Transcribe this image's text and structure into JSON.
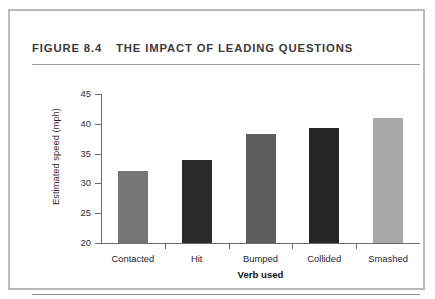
{
  "figure": {
    "number": "FIGURE 8.4",
    "title": "THE IMPACT OF LEADING QUESTIONS"
  },
  "chart_data": {
    "type": "bar",
    "title": "THE IMPACT OF LEADING QUESTIONS",
    "xlabel": "Verb used",
    "ylabel": "Estimated speed (mph)",
    "categories": [
      "Contacted",
      "Hit",
      "Bumped",
      "Collided",
      "Smashed"
    ],
    "values": [
      32.0,
      34.0,
      38.3,
      39.3,
      41.0
    ],
    "colors": [
      "#767676",
      "#2b2b2b",
      "#5e5e5e",
      "#262626",
      "#a8a8a8"
    ],
    "ylim": [
      20,
      45
    ],
    "yticks": [
      20,
      25,
      30,
      35,
      40,
      45
    ],
    "ytick_labels": [
      "20",
      "25",
      "30",
      "35",
      "40",
      "45"
    ],
    "grid": false,
    "legend": false
  },
  "colors": {
    "frame": "#b9b9b9",
    "axis": "#6b6b6b",
    "rule": "#9e9e9e",
    "text": "#2e2e2e"
  }
}
